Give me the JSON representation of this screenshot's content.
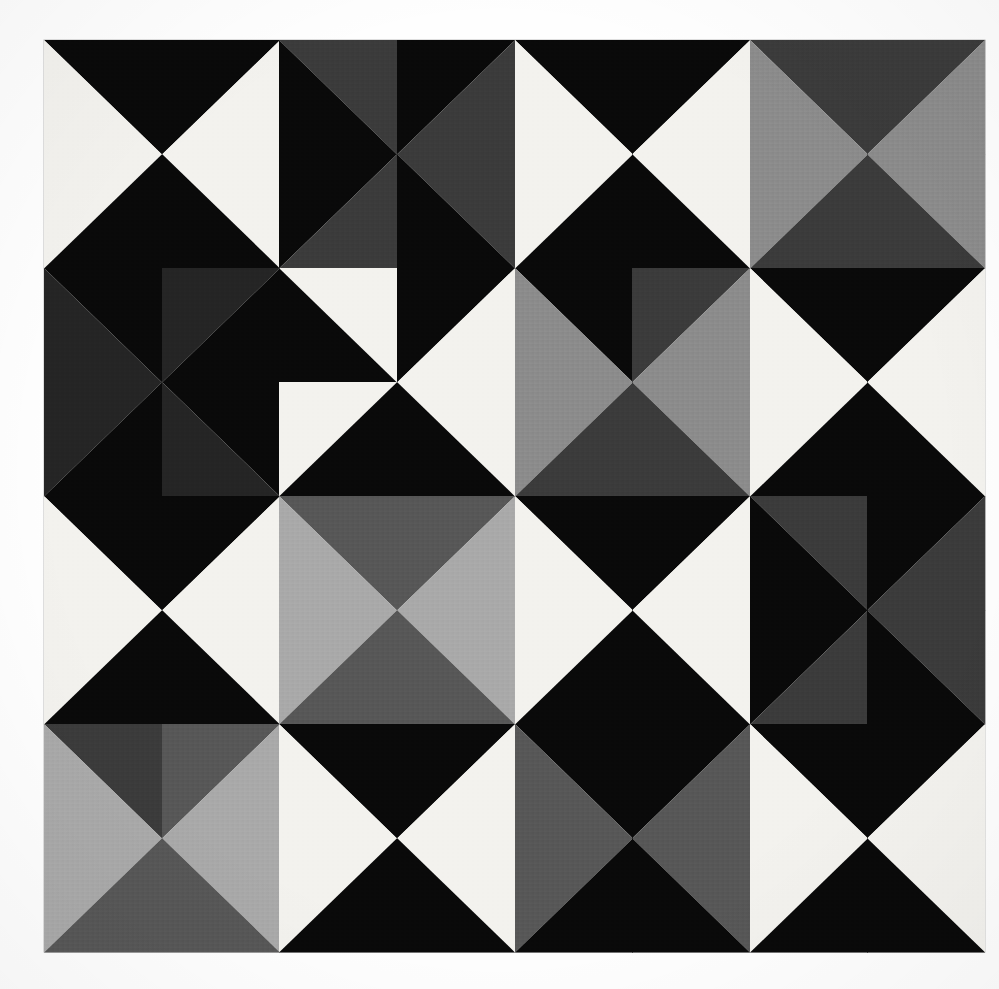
{
  "artwork": {
    "title": "Pinwheel Half-Square-Triangle Quilt",
    "medium": "photograph of a pieced fabric quilt",
    "grid": {
      "rows": 8,
      "cols": 8
    },
    "canvas": {
      "x": 44,
      "y": 40,
      "width": 941,
      "height": 912
    },
    "background_color": "#fefefe",
    "seam_color": "#f4f4f2",
    "palette": {
      "black": "#090909",
      "near_black": "#151515",
      "very_dark_gray": "#242424",
      "dark_gray": "#3a3a3a",
      "mid_dark_gray": "#565656",
      "mid_gray": "#6f6f6f",
      "gray": "#8a8a8a",
      "light_gray": "#a8a8a8",
      "pale_gray": "#c6c6c6",
      "white": "#f3f2ee",
      "off_white": "#e9e8e2"
    },
    "cells": [
      [
        {
          "d": "tlbr",
          "a": "black",
          "b": "white"
        },
        {
          "d": "trbl",
          "a": "black",
          "b": "white"
        },
        {
          "d": "tlbr",
          "a": "dark_gray",
          "b": "black"
        },
        {
          "d": "trbl",
          "a": "black",
          "b": "dark_gray"
        },
        {
          "d": "tlbr",
          "a": "black",
          "b": "white"
        },
        {
          "d": "trbl",
          "a": "black",
          "b": "white"
        },
        {
          "d": "tlbr",
          "a": "dark_gray",
          "b": "gray"
        },
        {
          "d": "trbl",
          "a": "dark_gray",
          "b": "gray"
        }
      ],
      [
        {
          "d": "trbl",
          "a": "white",
          "b": "black"
        },
        {
          "d": "tlbr",
          "a": "white",
          "b": "black"
        },
        {
          "d": "trbl",
          "a": "black",
          "b": "dark_gray"
        },
        {
          "d": "tlbr",
          "a": "dark_gray",
          "b": "black"
        },
        {
          "d": "trbl",
          "a": "white",
          "b": "black"
        },
        {
          "d": "tlbr",
          "a": "white",
          "b": "black"
        },
        {
          "d": "trbl",
          "a": "gray",
          "b": "dark_gray"
        },
        {
          "d": "tlbr",
          "a": "gray",
          "b": "dark_gray"
        }
      ],
      [
        {
          "d": "tlbr",
          "a": "black",
          "b": "very_dark_gray"
        },
        {
          "d": "trbl",
          "a": "very_dark_gray",
          "b": "black"
        },
        {
          "d": "tlbr",
          "a": "white",
          "b": "black"
        },
        {
          "d": "trbl",
          "a": "black",
          "b": "white"
        },
        {
          "d": "tlbr",
          "a": "black",
          "b": "gray"
        },
        {
          "d": "trbl",
          "a": "dark_gray",
          "b": "gray"
        },
        {
          "d": "tlbr",
          "a": "black",
          "b": "white"
        },
        {
          "d": "trbl",
          "a": "black",
          "b": "white"
        }
      ],
      [
        {
          "d": "trbl",
          "a": "very_dark_gray",
          "b": "black"
        },
        {
          "d": "tlbr",
          "a": "black",
          "b": "very_dark_gray"
        },
        {
          "d": "trbl",
          "a": "white",
          "b": "black"
        },
        {
          "d": "tlbr",
          "a": "white",
          "b": "black"
        },
        {
          "d": "trbl",
          "a": "gray",
          "b": "dark_gray"
        },
        {
          "d": "tlbr",
          "a": "gray",
          "b": "dark_gray"
        },
        {
          "d": "trbl",
          "a": "white",
          "b": "black"
        },
        {
          "d": "tlbr",
          "a": "white",
          "b": "black"
        }
      ],
      [
        {
          "d": "tlbr",
          "a": "black",
          "b": "white"
        },
        {
          "d": "trbl",
          "a": "black",
          "b": "white"
        },
        {
          "d": "tlbr",
          "a": "mid_dark_gray",
          "b": "light_gray"
        },
        {
          "d": "trbl",
          "a": "mid_dark_gray",
          "b": "light_gray"
        },
        {
          "d": "tlbr",
          "a": "black",
          "b": "white"
        },
        {
          "d": "trbl",
          "a": "black",
          "b": "white"
        },
        {
          "d": "tlbr",
          "a": "dark_gray",
          "b": "black"
        },
        {
          "d": "trbl",
          "a": "black",
          "b": "dark_gray"
        }
      ],
      [
        {
          "d": "trbl",
          "a": "white",
          "b": "black"
        },
        {
          "d": "tlbr",
          "a": "white",
          "b": "black"
        },
        {
          "d": "trbl",
          "a": "light_gray",
          "b": "mid_dark_gray"
        },
        {
          "d": "tlbr",
          "a": "light_gray",
          "b": "mid_dark_gray"
        },
        {
          "d": "trbl",
          "a": "white",
          "b": "black"
        },
        {
          "d": "tlbr",
          "a": "white",
          "b": "black"
        },
        {
          "d": "trbl",
          "a": "black",
          "b": "dark_gray"
        },
        {
          "d": "tlbr",
          "a": "dark_gray",
          "b": "black"
        }
      ],
      [
        {
          "d": "tlbr",
          "a": "dark_gray",
          "b": "light_gray"
        },
        {
          "d": "trbl",
          "a": "mid_dark_gray",
          "b": "light_gray"
        },
        {
          "d": "tlbr",
          "a": "black",
          "b": "white"
        },
        {
          "d": "trbl",
          "a": "black",
          "b": "white"
        },
        {
          "d": "tlbr",
          "a": "black",
          "b": "mid_dark_gray"
        },
        {
          "d": "trbl",
          "a": "black",
          "b": "mid_dark_gray"
        },
        {
          "d": "tlbr",
          "a": "black",
          "b": "white"
        },
        {
          "d": "trbl",
          "a": "black",
          "b": "white"
        }
      ],
      [
        {
          "d": "trbl",
          "a": "light_gray",
          "b": "mid_dark_gray"
        },
        {
          "d": "tlbr",
          "a": "light_gray",
          "b": "mid_dark_gray"
        },
        {
          "d": "trbl",
          "a": "white",
          "b": "black"
        },
        {
          "d": "tlbr",
          "a": "white",
          "b": "black"
        },
        {
          "d": "trbl",
          "a": "mid_dark_gray",
          "b": "black"
        },
        {
          "d": "tlbr",
          "a": "mid_dark_gray",
          "b": "black"
        },
        {
          "d": "trbl",
          "a": "white",
          "b": "black"
        },
        {
          "d": "tlbr",
          "a": "white",
          "b": "black"
        }
      ]
    ]
  }
}
